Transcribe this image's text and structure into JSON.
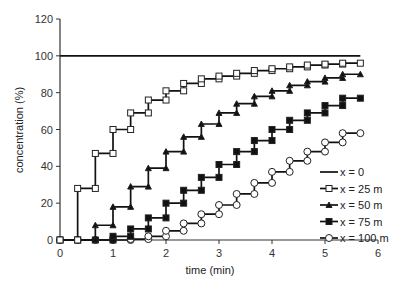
{
  "chart_data": {
    "type": "line",
    "title": "",
    "xlabel": "time (min)",
    "ylabel": "concentration (%)",
    "xlim": [
      0,
      6
    ],
    "ylim": [
      0,
      120
    ],
    "xticks": [
      0,
      1,
      2,
      3,
      4,
      5,
      6
    ],
    "yticks": [
      0,
      20,
      40,
      60,
      80,
      100,
      120
    ],
    "grid": false,
    "legend_position": "lower right",
    "step_style": "staircase (post)",
    "x": [
      0,
      0.333,
      0.667,
      1.0,
      1.333,
      1.667,
      2.0,
      2.333,
      2.667,
      3.0,
      3.333,
      3.667,
      4.0,
      4.333,
      4.667,
      5.0,
      5.333,
      5.667
    ],
    "series": [
      {
        "name": "x = 0",
        "marker": "none",
        "values": [
          100,
          100,
          100,
          100,
          100,
          100,
          100,
          100,
          100,
          100,
          100,
          100,
          100,
          100,
          100,
          100,
          100,
          100
        ]
      },
      {
        "name": "x = 25 m",
        "marker": "open-square",
        "values": [
          0,
          28,
          47,
          60,
          69,
          76,
          81,
          85,
          87.5,
          89,
          90.5,
          92,
          93,
          94,
          95,
          95.5,
          96,
          96
        ]
      },
      {
        "name": "x = 50 m",
        "marker": "filled-triangle",
        "values": [
          0,
          0,
          8,
          18,
          29,
          39,
          48,
          56,
          63,
          69,
          74,
          78,
          81,
          84,
          86,
          88,
          90,
          90
        ]
      },
      {
        "name": "x = 75 m",
        "marker": "filled-square",
        "values": [
          0,
          0,
          0,
          2,
          6,
          12,
          20,
          27,
          34,
          41,
          48,
          54,
          60,
          65,
          69,
          73,
          77,
          77
        ]
      },
      {
        "name": "x = 100 m",
        "marker": "open-circle",
        "values": [
          0,
          0,
          0,
          0,
          0.5,
          2,
          5,
          9,
          14,
          19,
          25,
          31,
          37,
          43,
          48,
          53,
          58,
          58
        ]
      }
    ]
  },
  "axes": {
    "x_title": "time (min)",
    "y_title": "concentration (%)"
  },
  "legend": {
    "items": [
      "x = 0",
      "x = 25 m",
      "x = 50 m",
      "x = 75 m",
      "x = 100 m"
    ]
  }
}
